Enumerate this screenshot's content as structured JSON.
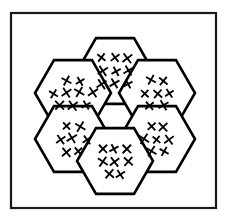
{
  "figure": {
    "background_color": "#ffffff",
    "stroke_color": "#000000",
    "frame_color": "#1a1a1a"
  },
  "frame": {
    "label": "outer-frame",
    "x": 11,
    "y": 13,
    "width": 205,
    "height": 195
  },
  "layout": {
    "orientation": "flat-top",
    "hex_radius": 38,
    "center_x": 115,
    "center_y": 116,
    "cell_count": 7,
    "filled_cell_count": 6,
    "empty_cell_count": 1
  },
  "cells": [
    {
      "name": "center",
      "position": "center",
      "cx": 115,
      "cy": 116,
      "filled": false,
      "x_count": 0,
      "x_rows": []
    },
    {
      "name": "top",
      "position": "top",
      "cx": 115,
      "cy": 71,
      "filled": true,
      "x_count": 9,
      "x_rows": [
        3,
        3,
        3
      ]
    },
    {
      "name": "upper-left",
      "position": "upper-left",
      "cx": 73,
      "cy": 93,
      "filled": true,
      "x_count": 9,
      "x_rows": [
        2,
        4,
        3
      ]
    },
    {
      "name": "upper-right",
      "position": "upper-right",
      "cx": 157,
      "cy": 93,
      "filled": true,
      "x_count": 7,
      "x_rows": [
        2,
        3,
        2
      ]
    },
    {
      "name": "lower-left",
      "position": "lower-left",
      "cx": 73,
      "cy": 139,
      "filled": true,
      "x_count": 7,
      "x_rows": [
        2,
        3,
        2
      ]
    },
    {
      "name": "lower-right",
      "position": "lower-right",
      "cx": 157,
      "cy": 139,
      "filled": true,
      "x_count": 7,
      "x_rows": [
        2,
        3,
        2
      ]
    },
    {
      "name": "bottom",
      "position": "bottom",
      "cx": 115,
      "cy": 161,
      "filled": true,
      "x_count": 8,
      "x_rows": [
        3,
        3,
        2
      ]
    }
  ]
}
